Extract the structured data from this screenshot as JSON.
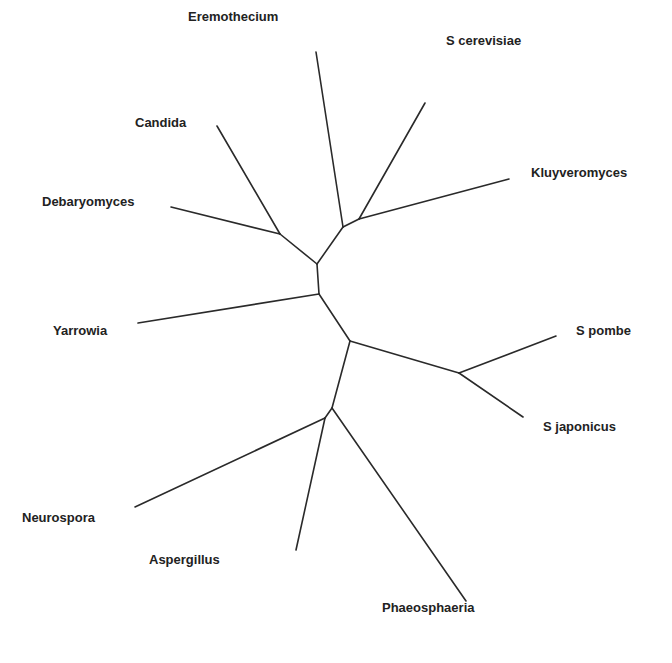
{
  "diagram": {
    "type": "unrooted phylogenetic tree",
    "line_color": "#2a2a2a",
    "text_color": "#222222",
    "taxa": [
      {
        "id": "eremothecium",
        "label": "Eremothecium",
        "label_x": 188,
        "label_y": 10
      },
      {
        "id": "s_cerevisiae",
        "label": "S cerevisiae",
        "label_x": 446,
        "label_y": 34
      },
      {
        "id": "kluyveromyces",
        "label": "Kluyveromyces",
        "label_x": 531,
        "label_y": 166
      },
      {
        "id": "candida",
        "label": "Candida",
        "label_x": 135,
        "label_y": 116
      },
      {
        "id": "debaryomyces",
        "label": "Debaryomyces",
        "label_x": 42,
        "label_y": 195
      },
      {
        "id": "yarrowia",
        "label": "Yarrowia",
        "label_x": 53,
        "label_y": 324
      },
      {
        "id": "s_pombe",
        "label": "S pombe",
        "label_x": 576,
        "label_y": 324
      },
      {
        "id": "s_japonicus",
        "label": "S japonicus",
        "label_x": 543,
        "label_y": 420
      },
      {
        "id": "neurospora",
        "label": "Neurospora",
        "label_x": 22,
        "label_y": 511
      },
      {
        "id": "aspergillus",
        "label": "Aspergillus",
        "label_x": 149,
        "label_y": 553
      },
      {
        "id": "phaeosphaeria",
        "label": "Phaeosphaeria",
        "label_x": 382,
        "label_y": 601
      }
    ],
    "branches": [
      {
        "name": "branch-eremothecium",
        "x1": 316,
        "y1": 52,
        "x2": 343,
        "y2": 227
      },
      {
        "name": "branch-s-cerevisiae",
        "x1": 425,
        "y1": 103,
        "x2": 359,
        "y2": 219
      },
      {
        "name": "branch-kluyveromyces",
        "x1": 509,
        "y1": 179,
        "x2": 359,
        "y2": 219
      },
      {
        "name": "branch-sc-kl-internal",
        "x1": 359,
        "y1": 219,
        "x2": 343,
        "y2": 227
      },
      {
        "name": "branch-saccharomycetaceae-internal",
        "x1": 343,
        "y1": 227,
        "x2": 317,
        "y2": 264
      },
      {
        "name": "branch-candida",
        "x1": 217,
        "y1": 126,
        "x2": 280,
        "y2": 234
      },
      {
        "name": "branch-debaryomyces",
        "x1": 171,
        "y1": 207,
        "x2": 280,
        "y2": 234
      },
      {
        "name": "branch-cd-internal",
        "x1": 280,
        "y1": 234,
        "x2": 317,
        "y2": 264
      },
      {
        "name": "branch-saccharomycotina-internal",
        "x1": 317,
        "y1": 264,
        "x2": 319,
        "y2": 294
      },
      {
        "name": "branch-yarrowia",
        "x1": 138,
        "y1": 323,
        "x2": 319,
        "y2": 294
      },
      {
        "name": "branch-root-internal",
        "x1": 319,
        "y1": 294,
        "x2": 350,
        "y2": 341
      },
      {
        "name": "branch-schizo-internal",
        "x1": 350,
        "y1": 341,
        "x2": 459,
        "y2": 373
      },
      {
        "name": "branch-s-pombe",
        "x1": 459,
        "y1": 373,
        "x2": 556,
        "y2": 336
      },
      {
        "name": "branch-s-japonicus",
        "x1": 459,
        "y1": 373,
        "x2": 523,
        "y2": 417
      },
      {
        "name": "branch-pezizo-internal",
        "x1": 350,
        "y1": 341,
        "x2": 332,
        "y2": 408
      },
      {
        "name": "branch-phaeosphaeria",
        "x1": 332,
        "y1": 408,
        "x2": 466,
        "y2": 601
      },
      {
        "name": "branch-na-internal",
        "x1": 332,
        "y1": 408,
        "x2": 325,
        "y2": 418
      },
      {
        "name": "branch-neurospora",
        "x1": 325,
        "y1": 418,
        "x2": 135,
        "y2": 507
      },
      {
        "name": "branch-aspergillus",
        "x1": 325,
        "y1": 418,
        "x2": 296,
        "y2": 550
      }
    ]
  }
}
